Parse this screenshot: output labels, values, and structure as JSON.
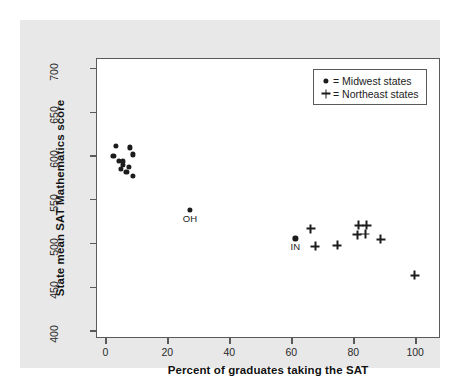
{
  "chart_data": {
    "type": "scatter",
    "title": "",
    "xlabel": "Percent of graduates taking the SAT",
    "ylabel": "State mean SAT Mathematics score",
    "xlim": [
      -3,
      108
    ],
    "ylim": [
      392,
      712
    ],
    "xticks": [
      0,
      20,
      40,
      60,
      80,
      100
    ],
    "xtick_labels": [
      "0",
      "20",
      "40",
      "60",
      "80",
      "100"
    ],
    "yticks": [
      400,
      450,
      500,
      550,
      600,
      650,
      700
    ],
    "ytick_labels": [
      "400",
      "450",
      "500",
      "550",
      "600",
      "650",
      "700"
    ],
    "grid": false,
    "legend_position": "top-right",
    "series": [
      {
        "name": "Midwest states",
        "marker": "dot",
        "legend_label": "= Midwest states",
        "points": [
          {
            "x": 3.0,
            "y": 613
          },
          {
            "x": 7.5,
            "y": 611
          },
          {
            "x": 2.3,
            "y": 601
          },
          {
            "x": 8.6,
            "y": 603
          },
          {
            "x": 4.2,
            "y": 596
          },
          {
            "x": 5.4,
            "y": 595
          },
          {
            "x": 5.3,
            "y": 591
          },
          {
            "x": 7.4,
            "y": 589
          },
          {
            "x": 4.6,
            "y": 586
          },
          {
            "x": 6.5,
            "y": 583
          },
          {
            "x": 8.5,
            "y": 578
          },
          {
            "x": 27.0,
            "y": 540,
            "label": "OH"
          },
          {
            "x": 61.0,
            "y": 507,
            "label": "IN"
          }
        ]
      },
      {
        "name": "Northeast states",
        "marker": "plus",
        "legend_label": "= Northeast states",
        "points": [
          {
            "x": 66.0,
            "y": 518
          },
          {
            "x": 67.5,
            "y": 498
          },
          {
            "x": 74.5,
            "y": 499
          },
          {
            "x": 81.5,
            "y": 522
          },
          {
            "x": 84.0,
            "y": 522
          },
          {
            "x": 81.0,
            "y": 511
          },
          {
            "x": 83.5,
            "y": 512
          },
          {
            "x": 88.5,
            "y": 506
          },
          {
            "x": 99.5,
            "y": 465
          }
        ]
      }
    ],
    "point_labels": [
      {
        "text": "OH",
        "x": 27.0,
        "y": 540
      },
      {
        "text": "IN",
        "x": 61.0,
        "y": 507
      }
    ],
    "colors": {
      "marker": "#1c1c1c",
      "axis": "#5a5a5a",
      "plot_background": "#ffffff",
      "panel_background": "#e8e8e8",
      "text": "#111111"
    }
  }
}
